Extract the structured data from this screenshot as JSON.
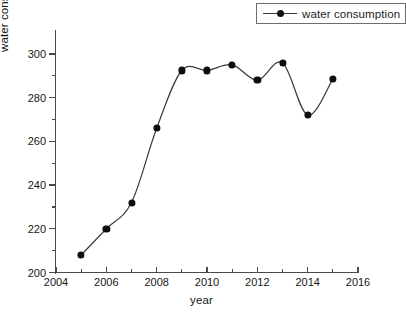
{
  "chart_data": {
    "type": "line",
    "title": "",
    "xlabel": "year",
    "ylabel": "water consumption(10⁸m³)",
    "ylabel_main": "water consumption(10",
    "ylabel_exp": "8",
    "ylabel_tail": "m",
    "ylabel_exp2": "3",
    "ylabel_close": ")",
    "legend": [
      "water consumption"
    ],
    "legend_position": "top-right",
    "grid": false,
    "xlim": [
      2004,
      2016
    ],
    "ylim": [
      200,
      305
    ],
    "x": [
      2005,
      2006,
      2007,
      2008,
      2009,
      2010,
      2011,
      2012,
      2013,
      2014,
      2015
    ],
    "values": [
      208,
      220,
      232,
      266,
      292.5,
      292.5,
      295,
      288,
      296,
      272,
      288.5
    ],
    "series": [
      {
        "name": "water consumption",
        "values": [
          208,
          220,
          232,
          266,
          292.5,
          292.5,
          295,
          288,
          296,
          272,
          288.5
        ]
      }
    ],
    "xticks_major": [
      2004,
      2006,
      2008,
      2010,
      2012,
      2014,
      2016
    ],
    "xticks_minor": [
      2005,
      2007,
      2009,
      2011,
      2013,
      2015
    ],
    "yticks_major": [
      200,
      220,
      240,
      260,
      280,
      300
    ],
    "yticks_minor": [
      210,
      230,
      250,
      270,
      290
    ],
    "xtick_labels": [
      "2004",
      "2006",
      "2008",
      "2010",
      "2012",
      "2014",
      "2016"
    ],
    "ytick_labels": [
      "200",
      "220",
      "240",
      "260",
      "280",
      "300"
    ],
    "line_color": "#3a3a3a",
    "marker_color": "#0d0d0d",
    "axis_color": "#4a4a4a"
  }
}
